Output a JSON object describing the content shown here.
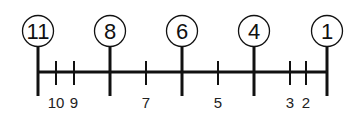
{
  "diagram": {
    "type": "number-line",
    "major_marks": [
      {
        "value": 11,
        "label": "⑪"
      },
      {
        "value": 8,
        "label": "⑧"
      },
      {
        "value": 6,
        "label": "⑥"
      },
      {
        "value": 4,
        "label": "④"
      },
      {
        "value": 1,
        "label": "①"
      }
    ],
    "minor_marks": [
      {
        "value": 10,
        "label": "10"
      },
      {
        "value": 9,
        "label": "9"
      },
      {
        "value": 7,
        "label": "7"
      },
      {
        "value": 5,
        "label": "5"
      },
      {
        "value": 3,
        "label": "3"
      },
      {
        "value": 2,
        "label": "2"
      }
    ],
    "direction": "descending-left-to-right",
    "colors": {
      "stroke": "#111111",
      "background": "#ffffff"
    }
  }
}
